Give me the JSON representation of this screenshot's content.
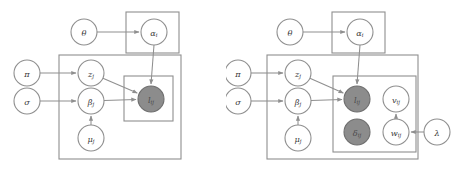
{
  "figure": {
    "type": "plate-notation-graphical-model",
    "background_color": "#ffffff",
    "line_color": "#8f8f8f",
    "observed_fill_color": "#8c8c8c",
    "unobserved_fill_color": "#ffffff",
    "label_color": "#3a3a3a",
    "panel_count": 2
  },
  "panels": [
    {
      "id": "left",
      "name": "basic-model",
      "nodes": [
        {
          "id": "theta",
          "label": "θ",
          "sub": "",
          "observed": false,
          "cx": 84,
          "cy": 32,
          "r": 13
        },
        {
          "id": "alpha",
          "label": "α",
          "sub": "i",
          "observed": false,
          "cx": 154,
          "cy": 32,
          "r": 13
        },
        {
          "id": "pi",
          "label": "π",
          "sub": "",
          "observed": false,
          "cx": 27,
          "cy": 73,
          "r": 13
        },
        {
          "id": "sigma",
          "label": "σ",
          "sub": "",
          "observed": false,
          "cx": 27,
          "cy": 101,
          "r": 13
        },
        {
          "id": "z",
          "label": "z",
          "sub": "j",
          "observed": false,
          "cx": 91,
          "cy": 73,
          "r": 13
        },
        {
          "id": "beta",
          "label": "β",
          "sub": "j",
          "observed": false,
          "cx": 91,
          "cy": 101,
          "r": 13
        },
        {
          "id": "mu",
          "label": "μ",
          "sub": "j",
          "observed": false,
          "cx": 91,
          "cy": 138,
          "r": 13
        },
        {
          "id": "l",
          "label": "l",
          "sub": "ij",
          "observed": true,
          "cx": 151,
          "cy": 99,
          "r": 13
        }
      ],
      "plates": [
        {
          "id": "plate-alpha-i",
          "x": 126,
          "y": 12,
          "w": 53,
          "h": 41
        },
        {
          "id": "plate-j",
          "x": 59,
          "y": 55,
          "w": 122,
          "h": 104
        },
        {
          "id": "plate-ij",
          "x": 124,
          "y": 76,
          "w": 49,
          "h": 45
        }
      ],
      "edges": [
        {
          "from": "theta",
          "to": "alpha",
          "kind": "elbow-right"
        },
        {
          "from": "pi",
          "to": "z",
          "kind": "elbow-right"
        },
        {
          "from": "sigma",
          "to": "beta",
          "kind": "elbow-right"
        },
        {
          "from": "mu",
          "to": "beta",
          "kind": "vertical-up"
        },
        {
          "from": "z",
          "to": "l",
          "kind": "diagonal"
        },
        {
          "from": "beta",
          "to": "l",
          "kind": "horizontal"
        },
        {
          "from": "alpha",
          "to": "l",
          "kind": "vertical-down"
        }
      ]
    },
    {
      "id": "right",
      "name": "extended-model",
      "nodes": [
        {
          "id": "theta",
          "label": "θ",
          "sub": "",
          "observed": false,
          "cx": 64,
          "cy": 32,
          "r": 13
        },
        {
          "id": "alpha",
          "label": "α",
          "sub": "i",
          "observed": false,
          "cx": 134,
          "cy": 32,
          "r": 13
        },
        {
          "id": "pi",
          "label": "π",
          "sub": "",
          "observed": false,
          "cx": 12,
          "cy": 73,
          "r": 13
        },
        {
          "id": "sigma",
          "label": "σ",
          "sub": "",
          "observed": false,
          "cx": 12,
          "cy": 101,
          "r": 13
        },
        {
          "id": "z",
          "label": "z",
          "sub": "j",
          "observed": false,
          "cx": 72,
          "cy": 73,
          "r": 13
        },
        {
          "id": "beta",
          "label": "β",
          "sub": "j",
          "observed": false,
          "cx": 72,
          "cy": 101,
          "r": 13
        },
        {
          "id": "mu",
          "label": "μ",
          "sub": "j",
          "observed": false,
          "cx": 72,
          "cy": 138,
          "r": 13
        },
        {
          "id": "l",
          "label": "l",
          "sub": "ij",
          "observed": true,
          "cx": 131,
          "cy": 99,
          "r": 13
        },
        {
          "id": "v",
          "label": "v",
          "sub": "ij",
          "observed": false,
          "cx": 170,
          "cy": 99,
          "r": 13
        },
        {
          "id": "delta",
          "label": "δ",
          "sub": "ij",
          "observed": true,
          "cx": 131,
          "cy": 132,
          "r": 13
        },
        {
          "id": "w",
          "label": "w",
          "sub": "ij",
          "observed": false,
          "cx": 170,
          "cy": 132,
          "r": 13
        },
        {
          "id": "lambda",
          "label": "λ",
          "sub": "",
          "observed": false,
          "cx": 211,
          "cy": 132,
          "r": 13
        }
      ],
      "plates": [
        {
          "id": "plate-alpha-i",
          "x": 106,
          "y": 12,
          "w": 53,
          "h": 41
        },
        {
          "id": "plate-j",
          "x": 41,
          "y": 55,
          "w": 151,
          "h": 104
        },
        {
          "id": "plate-ij",
          "x": 107,
          "y": 76,
          "w": 83,
          "h": 76
        }
      ],
      "edges": [
        {
          "from": "theta",
          "to": "alpha",
          "kind": "elbow-right"
        },
        {
          "from": "pi",
          "to": "z",
          "kind": "elbow-right"
        },
        {
          "from": "sigma",
          "to": "beta",
          "kind": "elbow-right"
        },
        {
          "from": "mu",
          "to": "beta",
          "kind": "vertical-up"
        },
        {
          "from": "z",
          "to": "l",
          "kind": "diagonal"
        },
        {
          "from": "beta",
          "to": "l",
          "kind": "horizontal"
        },
        {
          "from": "alpha",
          "to": "l",
          "kind": "vertical-down"
        },
        {
          "from": "lambda",
          "to": "w",
          "kind": "horizontal-left"
        },
        {
          "from": "w",
          "to": "v",
          "kind": "vertical-up"
        }
      ]
    }
  ]
}
